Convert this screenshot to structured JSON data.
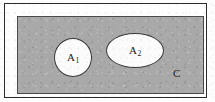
{
  "figure": {
    "kind": "set-diagram",
    "background_color": "#ffffff",
    "frame": {
      "border_color": "#2b2b2b",
      "fill_color": "#fefefe"
    },
    "universe": {
      "label": "C",
      "shape": "rectangle",
      "fill_color": "#a9a9a9",
      "border_color": "#4a4a4a",
      "label_color": "#1c1c1c"
    },
    "sets": [
      {
        "name": "A1",
        "label_base": "A",
        "label_sub": "1",
        "shape": "circle",
        "fill_color": "#fbfbfb",
        "border_color": "#3a3a3a"
      },
      {
        "name": "A2",
        "label_base": "A",
        "label_sub": "2",
        "shape": "ellipse",
        "fill_color": "#fbfbfb",
        "border_color": "#3a3a3a"
      }
    ]
  }
}
